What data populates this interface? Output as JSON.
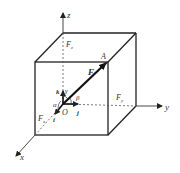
{
  "diagram": {
    "axes": {
      "x_label": "x",
      "y_label": "y",
      "z_label": "z"
    },
    "points": {
      "origin_label": "O",
      "tip_label": "A"
    },
    "force": {
      "label": "F",
      "components": {
        "fx": {
          "base": "F",
          "sub": "x"
        },
        "fy": {
          "base": "F",
          "sub": "y"
        },
        "fz": {
          "base": "F",
          "sub": "z"
        }
      }
    },
    "unit_vectors": {
      "i": "i",
      "j": "j",
      "k": "k"
    },
    "angles": {
      "alpha": "α",
      "beta": "β",
      "gamma": "γ"
    },
    "colors": {
      "stroke": "#222222",
      "dashed": "#555555",
      "text": "#333333"
    }
  }
}
